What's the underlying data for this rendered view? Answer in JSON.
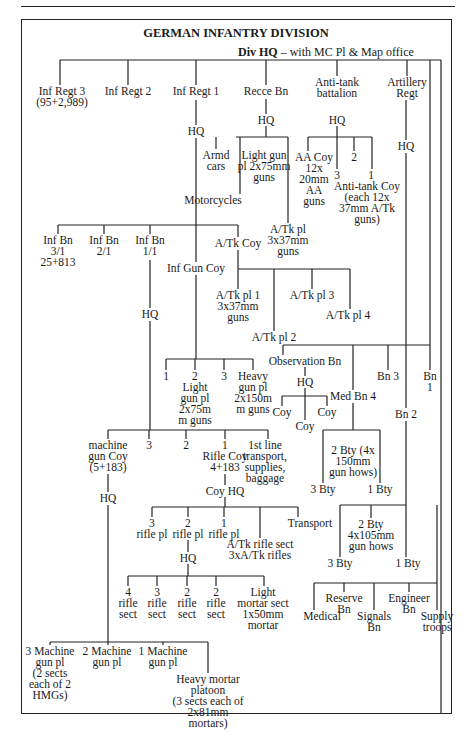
{
  "title": "GERMAN INFANTRY DIVISION",
  "div_hq": {
    "bold": "Div HQ",
    "rest": " – with MC Pl & Map office"
  },
  "nodes": [
    {
      "id": "inf-regt-3",
      "text": "Inf Regt 3\n(95+2,989)",
      "x": 62,
      "y": 86
    },
    {
      "id": "inf-regt-2",
      "text": "Inf Regt 2",
      "x": 128,
      "y": 86
    },
    {
      "id": "inf-regt-1",
      "text": "Inf Regt 1",
      "x": 196,
      "y": 86
    },
    {
      "id": "recce-bn",
      "text": "Recce Bn",
      "x": 266,
      "y": 86
    },
    {
      "id": "anti-tank-battalion",
      "text": "Anti-tank\nbattalion",
      "x": 337,
      "y": 77
    },
    {
      "id": "artillery-regt",
      "text": "Artillery\nRegt",
      "x": 407,
      "y": 77
    },
    {
      "id": "inf-regt-1-hq",
      "text": "HQ",
      "x": 196,
      "y": 126
    },
    {
      "id": "recce-hq",
      "text": "HQ",
      "x": 266,
      "y": 115
    },
    {
      "id": "at-bn-hq",
      "text": "HQ",
      "x": 337,
      "y": 115
    },
    {
      "id": "arty-hq",
      "text": "HQ",
      "x": 406,
      "y": 141
    },
    {
      "id": "armd-cars",
      "text": "Armd\ncars",
      "x": 216,
      "y": 150
    },
    {
      "id": "light-gun-pl",
      "text": "Light gun\npl 2x75mm\nguns",
      "x": 264,
      "y": 150
    },
    {
      "id": "motorcycles",
      "text": "Motorcycles",
      "x": 213,
      "y": 195
    },
    {
      "id": "aa-coy",
      "text": "AA Coy\n12x\n20mm\nAA\nguns",
      "x": 314,
      "y": 152
    },
    {
      "id": "at-coy-3",
      "text": "3",
      "x": 337,
      "y": 170
    },
    {
      "id": "at-coy-2",
      "text": "2",
      "x": 354,
      "y": 152
    },
    {
      "id": "at-coy-1",
      "text": "1",
      "x": 371,
      "y": 170
    },
    {
      "id": "anti-tank-coy",
      "text": "Anti-tank Coy\n(each 12x\n37mm A/Tk\nguns)",
      "x": 367,
      "y": 181
    },
    {
      "id": "recce-at-pl",
      "text": "A/Tk pl\n3x37mm\nguns",
      "x": 288,
      "y": 224
    },
    {
      "id": "inf-bn-3-1",
      "text": "Inf Bn\n3/1\n25+813",
      "x": 58,
      "y": 235
    },
    {
      "id": "inf-bn-2-1",
      "text": "Inf Bn\n2/1",
      "x": 104,
      "y": 235
    },
    {
      "id": "inf-bn-1-1",
      "text": "Inf Bn\n1/1",
      "x": 150,
      "y": 235
    },
    {
      "id": "regt-at-coy",
      "text": "A/Tk Coy",
      "x": 238,
      "y": 238
    },
    {
      "id": "inf-gun-coy",
      "text": "Inf Gun Coy",
      "x": 196,
      "y": 263
    },
    {
      "id": "bn-hq",
      "text": "HQ",
      "x": 150,
      "y": 309
    },
    {
      "id": "at-pl-1",
      "text": "A/Tk pl 1\n3x37mm\nguns",
      "x": 238,
      "y": 290
    },
    {
      "id": "at-pl-2",
      "text": "A/Tk pl 2",
      "x": 274,
      "y": 332
    },
    {
      "id": "at-pl-3",
      "text": "A/Tk pl 3",
      "x": 312,
      "y": 290
    },
    {
      "id": "at-pl-4",
      "text": "A/Tk pl 4",
      "x": 348,
      "y": 310
    },
    {
      "id": "gun-pl-1",
      "text": "1",
      "x": 166,
      "y": 371
    },
    {
      "id": "gun-pl-2",
      "text": "2\nLight\ngun pl\n2x75m\nm guns",
      "x": 195,
      "y": 371
    },
    {
      "id": "gun-pl-3",
      "text": "3",
      "x": 224,
      "y": 371
    },
    {
      "id": "heavy-gun-pl",
      "text": "Heavy\ngun pl\n2x150m\nm guns",
      "x": 253,
      "y": 371
    },
    {
      "id": "observation-bn",
      "text": "Observation Bn",
      "x": 305,
      "y": 356
    },
    {
      "id": "obs-hq",
      "text": "HQ",
      "x": 305,
      "y": 377
    },
    {
      "id": "obs-coy-left",
      "text": "Coy",
      "x": 282,
      "y": 407
    },
    {
      "id": "obs-coy-mid",
      "text": "Coy",
      "x": 305,
      "y": 421
    },
    {
      "id": "obs-coy-right",
      "text": "Coy",
      "x": 327,
      "y": 407
    },
    {
      "id": "med-bn-4",
      "text": "Med Bn 4",
      "x": 353,
      "y": 391
    },
    {
      "id": "bn-3",
      "text": "Bn 3",
      "x": 388,
      "y": 371
    },
    {
      "id": "bn-1",
      "text": "Bn\n1",
      "x": 430,
      "y": 371
    },
    {
      "id": "bn-2",
      "text": "Bn 2",
      "x": 406,
      "y": 409
    },
    {
      "id": "mg-coy",
      "text": "machine\ngun Coy\n(5+183)",
      "x": 108,
      "y": 440
    },
    {
      "id": "bn-coy-3",
      "text": "3",
      "x": 149,
      "y": 440
    },
    {
      "id": "bn-coy-2",
      "text": "2",
      "x": 186,
      "y": 440
    },
    {
      "id": "rifle-coy",
      "text": "1\nRifle Coy\n4+183",
      "x": 225,
      "y": 440
    },
    {
      "id": "first-line-transport",
      "text": "1st line\ntransport,\nsupplies,\nbaggage",
      "x": 265,
      "y": 440
    },
    {
      "id": "med-2-bty",
      "text": "2 Bty (4x\n150mm\ngun hows)",
      "x": 353,
      "y": 445
    },
    {
      "id": "med-3-bty",
      "text": "3 Bty",
      "x": 323,
      "y": 484
    },
    {
      "id": "med-1-bty",
      "text": "1 Bty",
      "x": 380,
      "y": 484
    },
    {
      "id": "mg-coy-hq",
      "text": "HQ",
      "x": 108,
      "y": 493
    },
    {
      "id": "coy-hq",
      "text": "Coy HQ",
      "x": 225,
      "y": 486
    },
    {
      "id": "rifle-pl-3",
      "text": "3\nrifle pl",
      "x": 152,
      "y": 518
    },
    {
      "id": "rifle-pl-2",
      "text": "2\nrifle pl",
      "x": 188,
      "y": 518
    },
    {
      "id": "rifle-pl-1",
      "text": "1\nrifle pl",
      "x": 224,
      "y": 518
    },
    {
      "id": "at-rifle-sect",
      "text": "A/Tk rifle sect\n3xA/Tk rifles",
      "x": 260,
      "y": 539
    },
    {
      "id": "transport",
      "text": "Transport",
      "x": 310,
      "y": 518
    },
    {
      "id": "pl-hq",
      "text": "HQ",
      "x": 188,
      "y": 553
    },
    {
      "id": "lt-2-bty",
      "text": "2 Bty\n4x105mm\ngun hows",
      "x": 371,
      "y": 519
    },
    {
      "id": "lt-3-bty",
      "text": "3 Bty",
      "x": 340,
      "y": 558
    },
    {
      "id": "lt-1-bty",
      "text": "1 Bty",
      "x": 408,
      "y": 558
    },
    {
      "id": "rifle-sect-4",
      "text": "4\nrifle\nsect",
      "x": 128,
      "y": 587
    },
    {
      "id": "rifle-sect-3",
      "text": "3\nrifle\nsect",
      "x": 157,
      "y": 587
    },
    {
      "id": "rifle-sect-2a",
      "text": "2\nrifle\nsect",
      "x": 187,
      "y": 587
    },
    {
      "id": "rifle-sect-2b",
      "text": "2\nrifle\nsect",
      "x": 216,
      "y": 587
    },
    {
      "id": "light-mortar-sect",
      "text": "Light\nmortar sect\n1x50mm\nmortar",
      "x": 263,
      "y": 587
    },
    {
      "id": "reserve-bn",
      "text": "Reserve\nBn",
      "x": 344,
      "y": 593
    },
    {
      "id": "engineer-bn",
      "text": "Engineer\nBn",
      "x": 409,
      "y": 593
    },
    {
      "id": "medical",
      "text": "Medical",
      "x": 322,
      "y": 611
    },
    {
      "id": "signals-bn",
      "text": "Signals\nBn",
      "x": 374,
      "y": 611
    },
    {
      "id": "supply-troops",
      "text": "Supply\ntroops",
      "x": 437,
      "y": 611
    },
    {
      "id": "mg-pl-3",
      "text": "3 Machine\ngun pl\n(2 sects\neach of 2\nHMGs)",
      "x": 50,
      "y": 646
    },
    {
      "id": "mg-pl-2",
      "text": "2 Machine\ngun pl",
      "x": 107,
      "y": 646
    },
    {
      "id": "mg-pl-1",
      "text": "1 Machine\ngun pl",
      "x": 163,
      "y": 646
    },
    {
      "id": "heavy-mortar-pl",
      "text": "Heavy mortar\nplatoon\n(3 sects each of\n2x81mm\nmortars)",
      "x": 208,
      "y": 674
    }
  ],
  "lines": [
    [
      60,
      60,
      441,
      60
    ],
    [
      60,
      60,
      60,
      85
    ],
    [
      128,
      60,
      128,
      85
    ],
    [
      196,
      60,
      196,
      85
    ],
    [
      266,
      60,
      266,
      85
    ],
    [
      337,
      60,
      337,
      76
    ],
    [
      407,
      60,
      407,
      76
    ],
    [
      441,
      60,
      441,
      714
    ],
    [
      196,
      100,
      196,
      125
    ],
    [
      196,
      138,
      196,
      262
    ],
    [
      266,
      99,
      266,
      114
    ],
    [
      266,
      126,
      266,
      137
    ],
    [
      236,
      137,
      288,
      137
    ],
    [
      216,
      137,
      216,
      149
    ],
    [
      240,
      137,
      240,
      194
    ],
    [
      288,
      137,
      288,
      223
    ],
    [
      337,
      126,
      337,
      137
    ],
    [
      308,
      137,
      372,
      137
    ],
    [
      308,
      137,
      308,
      151
    ],
    [
      337,
      137,
      337,
      169
    ],
    [
      354,
      137,
      354,
      151
    ],
    [
      372,
      137,
      372,
      169
    ],
    [
      406,
      100,
      406,
      140
    ],
    [
      406,
      153,
      406,
      408
    ],
    [
      430,
      60,
      430,
      370
    ],
    [
      58,
      225,
      238,
      225
    ],
    [
      58,
      225,
      58,
      234
    ],
    [
      104,
      225,
      104,
      234
    ],
    [
      150,
      225,
      150,
      234
    ],
    [
      238,
      225,
      238,
      237
    ],
    [
      238,
      250,
      238,
      289
    ],
    [
      238,
      269,
      350,
      269
    ],
    [
      274,
      269,
      274,
      331
    ],
    [
      312,
      269,
      312,
      289
    ],
    [
      350,
      269,
      350,
      309
    ],
    [
      150,
      260,
      150,
      308
    ],
    [
      150,
      321,
      150,
      430
    ],
    [
      196,
      275,
      196,
      359
    ],
    [
      166,
      359,
      253,
      359
    ],
    [
      166,
      359,
      166,
      370
    ],
    [
      195,
      359,
      195,
      370
    ],
    [
      224,
      359,
      224,
      370
    ],
    [
      253,
      359,
      253,
      370
    ],
    [
      283,
      345,
      430,
      345
    ],
    [
      283,
      345,
      283,
      355
    ],
    [
      353,
      345,
      353,
      390
    ],
    [
      388,
      345,
      388,
      370
    ],
    [
      305,
      367,
      305,
      376
    ],
    [
      305,
      388,
      305,
      396
    ],
    [
      282,
      396,
      327,
      396
    ],
    [
      282,
      396,
      282,
      406
    ],
    [
      305,
      396,
      305,
      420
    ],
    [
      327,
      396,
      327,
      406
    ],
    [
      353,
      403,
      353,
      430
    ],
    [
      323,
      430,
      380,
      430
    ],
    [
      323,
      430,
      323,
      483
    ],
    [
      380,
      430,
      380,
      483
    ],
    [
      406,
      421,
      406,
      505
    ],
    [
      108,
      430,
      268,
      430
    ],
    [
      108,
      430,
      108,
      439
    ],
    [
      149,
      430,
      149,
      439
    ],
    [
      186,
      430,
      186,
      439
    ],
    [
      225,
      430,
      225,
      439
    ],
    [
      268,
      430,
      268,
      439
    ],
    [
      108,
      474,
      108,
      492
    ],
    [
      108,
      505,
      108,
      642
    ],
    [
      225,
      474,
      225,
      485
    ],
    [
      225,
      497,
      225,
      507
    ],
    [
      152,
      507,
      298,
      507
    ],
    [
      152,
      507,
      152,
      517
    ],
    [
      188,
      507,
      188,
      517
    ],
    [
      224,
      507,
      224,
      517
    ],
    [
      260,
      507,
      260,
      538
    ],
    [
      298,
      507,
      298,
      517
    ],
    [
      188,
      540,
      188,
      552
    ],
    [
      188,
      564,
      188,
      576
    ],
    [
      128,
      576,
      264,
      576
    ],
    [
      128,
      576,
      128,
      586
    ],
    [
      157,
      576,
      157,
      586
    ],
    [
      187,
      576,
      187,
      586
    ],
    [
      216,
      576,
      216,
      586
    ],
    [
      264,
      576,
      264,
      586
    ],
    [
      340,
      505,
      406,
      505
    ],
    [
      371,
      505,
      371,
      518
    ],
    [
      340,
      505,
      340,
      557
    ],
    [
      406,
      505,
      406,
      557
    ],
    [
      437,
      583,
      437,
      610
    ],
    [
      314,
      583,
      437,
      583
    ],
    [
      314,
      583,
      314,
      610
    ],
    [
      344,
      583,
      344,
      592
    ],
    [
      374,
      583,
      374,
      610
    ],
    [
      409,
      583,
      409,
      592
    ],
    [
      437,
      505,
      437,
      583
    ],
    [
      50,
      642,
      208,
      642
    ],
    [
      50,
      642,
      50,
      645
    ],
    [
      108,
      642,
      108,
      645
    ],
    [
      163,
      642,
      163,
      645
    ],
    [
      208,
      642,
      208,
      673
    ]
  ]
}
